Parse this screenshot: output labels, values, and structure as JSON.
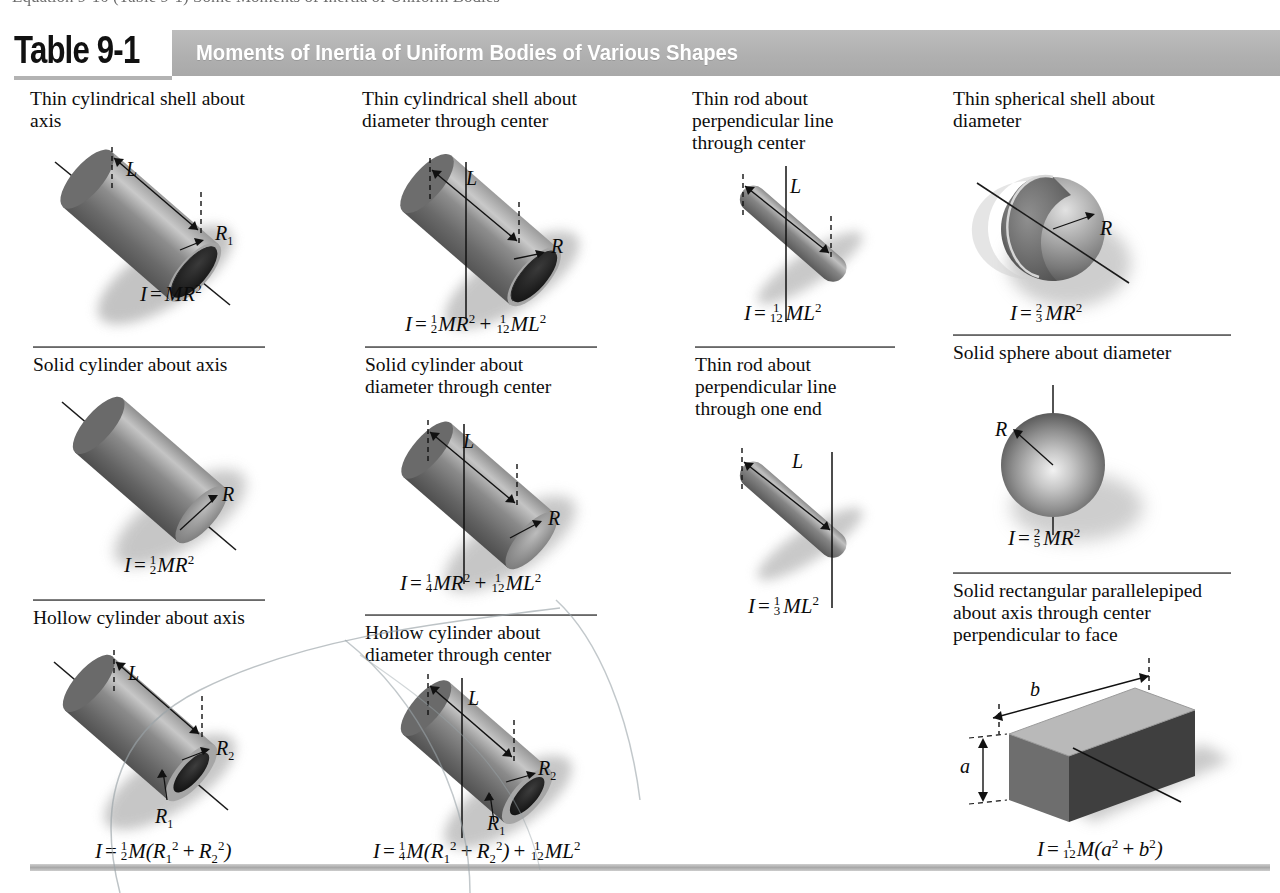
{
  "page": {
    "clipped_top_line": "Equation 9-10 (Table 9-1) Some Moments of Inertia of Uniform Bodies"
  },
  "header": {
    "table_number": "Table 9-1",
    "title": "Moments of Inertia of Uniform Bodies of Various Shapes",
    "band_color": "#b3b3b3",
    "title_color": "#ffffff",
    "number_color": "#111111"
  },
  "columns": [
    {
      "index": 1,
      "entries": [
        {
          "caption": "Thin cylindrical shell about\naxis",
          "shape": "hollow-cylinder-open",
          "dimension_labels": [
            "L",
            "R₁"
          ],
          "formula_plain": "I = MR²",
          "formula_parts": {
            "lhs": "I",
            "rel": "=",
            "coefficient": "",
            "body": "MR",
            "exponent": "2"
          }
        },
        {
          "caption": "Solid cylinder about axis",
          "shape": "solid-cylinder",
          "dimension_labels": [
            "R"
          ],
          "formula_plain": "I = 1/2 MR²",
          "formula_parts": {
            "lhs": "I",
            "rel": "=",
            "coefficient": "1/2",
            "body": "MR",
            "exponent": "2"
          }
        },
        {
          "caption": "Hollow cylinder about axis",
          "shape": "hollow-cylinder-thick",
          "dimension_labels": [
            "L",
            "R₁",
            "R₂"
          ],
          "formula_plain": "I = 1/2 M(R₁² + R₂²)",
          "formula_parts": {
            "lhs": "I",
            "rel": "=",
            "coefficient": "1/2",
            "body": "M(R₁² + R₂²)"
          }
        }
      ]
    },
    {
      "index": 2,
      "entries": [
        {
          "caption": "Thin cylindrical shell about\ndiameter through center",
          "shape": "hollow-cylinder-open",
          "dimension_labels": [
            "L",
            "R"
          ],
          "formula_plain": "I = 1/2 MR² + 1/12 ML²",
          "formula_parts": {
            "lhs": "I",
            "rel": "=",
            "terms": [
              "1/2 MR²",
              "1/12 ML²"
            ]
          }
        },
        {
          "caption": "Solid cylinder about\ndiameter through center",
          "shape": "solid-cylinder",
          "dimension_labels": [
            "L",
            "R"
          ],
          "formula_plain": "I = 1/4 MR² + 1/12 ML²",
          "formula_parts": {
            "lhs": "I",
            "rel": "=",
            "terms": [
              "1/4 MR²",
              "1/12 ML²"
            ]
          }
        },
        {
          "caption": "Hollow cylinder about\ndiameter through center",
          "shape": "hollow-cylinder-thick",
          "dimension_labels": [
            "L",
            "R₁",
            "R₂"
          ],
          "formula_plain": "I = 1/4 M(R₁² + R₂²) + 1/12 ML²",
          "formula_parts": {
            "lhs": "I",
            "rel": "=",
            "terms": [
              "1/4 M(R₁² + R₂²)",
              "1/12 ML²"
            ]
          }
        }
      ]
    },
    {
      "index": 3,
      "entries": [
        {
          "caption": "Thin rod about\nperpendicular line\nthrough center",
          "shape": "thin-rod",
          "dimension_labels": [
            "L"
          ],
          "formula_plain": "I = 1/12 ML²",
          "formula_parts": {
            "lhs": "I",
            "rel": "=",
            "coefficient": "1/12",
            "body": "ML",
            "exponent": "2"
          }
        },
        {
          "caption": "Thin rod about\nperpendicular line\nthrough one end",
          "shape": "thin-rod",
          "dimension_labels": [
            "L"
          ],
          "formula_plain": "I = 1/3 ML²",
          "formula_parts": {
            "lhs": "I",
            "rel": "=",
            "coefficient": "1/3",
            "body": "ML",
            "exponent": "2"
          }
        }
      ]
    },
    {
      "index": 4,
      "entries": [
        {
          "caption": "Thin spherical shell about\ndiameter",
          "shape": "spherical-shell",
          "dimension_labels": [
            "R"
          ],
          "formula_plain": "I = 2/3 MR²",
          "formula_parts": {
            "lhs": "I",
            "rel": "=",
            "coefficient": "2/3",
            "body": "MR",
            "exponent": "2"
          }
        },
        {
          "caption": "Solid sphere about diameter",
          "shape": "solid-sphere",
          "dimension_labels": [
            "R"
          ],
          "formula_plain": "I = 2/5 MR²",
          "formula_parts": {
            "lhs": "I",
            "rel": "=",
            "coefficient": "2/5",
            "body": "MR",
            "exponent": "2"
          }
        },
        {
          "caption": "Solid rectangular parallelepiped\nabout axis through center\nperpendicular to face",
          "shape": "rectangular-block",
          "dimension_labels": [
            "a",
            "b"
          ],
          "formula_plain": "I = 1/12 M(a² + b²)",
          "formula_parts": {
            "lhs": "I",
            "rel": "=",
            "coefficient": "1/12",
            "body": "M(a² + b²)"
          }
        }
      ]
    }
  ],
  "labels": {
    "L": "L",
    "R": "R",
    "R1": "R",
    "R1_sub": "1",
    "R2": "R",
    "R2_sub": "2",
    "a": "a",
    "b": "b"
  }
}
